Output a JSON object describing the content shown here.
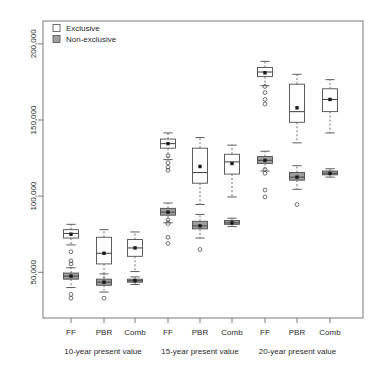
{
  "chart_data": {
    "type": "box",
    "title": "",
    "xlabel": "",
    "ylabel": "",
    "ylim": [
      20000,
      215000
    ],
    "yticks": [
      50000,
      100000,
      150000,
      200000
    ],
    "ytick_labels": [
      "50,000",
      "100,000",
      "150,000",
      "200,000"
    ],
    "grid": false,
    "legend": {
      "position": "top-left",
      "entries": [
        {
          "label": "Exclusive",
          "fill": "#ffffff",
          "stroke": "#4d4d4d"
        },
        {
          "label": "Non-exclusive",
          "fill": "#9e9e9e",
          "stroke": "#4d4d4d"
        }
      ]
    },
    "panels": [
      {
        "label": "10-year present value",
        "categories": [
          "FF",
          "PBR",
          "Comb"
        ]
      },
      {
        "label": "15-year present value",
        "categories": [
          "FF",
          "PBR",
          "Comb"
        ]
      },
      {
        "label": "20-year present value",
        "categories": [
          "FF",
          "PBR",
          "Comb"
        ]
      }
    ],
    "xtick_labels": [
      "FF",
      "PBR",
      "Comb",
      "FF",
      "PBR",
      "Comb",
      "FF",
      "PBR",
      "Comb"
    ],
    "series": [
      {
        "name": "Exclusive",
        "fill": "#ffffff",
        "boxes": [
          {
            "panel": "10-year present value",
            "category": "FF",
            "whisker_low": 68000,
            "q1": 72500,
            "median": 75500,
            "q3": 78000,
            "whisker_high": 81500,
            "mean": 75000,
            "outliers": [
              63500,
              57500,
              55500
            ]
          },
          {
            "panel": "10-year present value",
            "category": "PBR",
            "whisker_low": 43500,
            "q1": 55500,
            "median": 62500,
            "q3": 73000,
            "whisker_high": 78000,
            "mean": 62500,
            "outliers": []
          },
          {
            "panel": "10-year present value",
            "category": "Comb",
            "whisker_low": 50500,
            "q1": 60500,
            "median": 66000,
            "q3": 71500,
            "whisker_high": 76500,
            "mean": 66000,
            "outliers": []
          },
          {
            "panel": "15-year present value",
            "category": "FF",
            "whisker_low": 124000,
            "q1": 131500,
            "median": 134500,
            "q3": 137500,
            "whisker_high": 141500,
            "mean": 134500,
            "outliers": [
              126500,
              122000,
              119000,
              117000
            ]
          },
          {
            "panel": "15-year present value",
            "category": "PBR",
            "whisker_low": 94500,
            "q1": 108500,
            "median": 115500,
            "q3": 131500,
            "whisker_high": 138500,
            "mean": 119500,
            "outliers": []
          },
          {
            "panel": "15-year present value",
            "category": "Comb",
            "whisker_low": 99500,
            "q1": 114500,
            "median": 122500,
            "q3": 127500,
            "whisker_high": 133500,
            "mean": 121500,
            "outliers": []
          },
          {
            "panel": "20-year present value",
            "category": "FF",
            "whisker_low": 172500,
            "q1": 178500,
            "median": 181500,
            "q3": 184500,
            "whisker_high": 188500,
            "mean": 181000,
            "outliers": [
              172000,
              168000,
              163500,
              160500
            ]
          },
          {
            "panel": "20-year present value",
            "category": "PBR",
            "whisker_low": 135000,
            "q1": 148500,
            "median": 155500,
            "q3": 173500,
            "whisker_high": 180000,
            "mean": 158000,
            "outliers": []
          },
          {
            "panel": "20-year present value",
            "category": "Comb",
            "whisker_low": 141500,
            "q1": 155500,
            "median": 163500,
            "q3": 170500,
            "whisker_high": 176500,
            "mean": 163500,
            "outliers": []
          }
        ]
      },
      {
        "name": "Non-exclusive",
        "fill": "#9e9e9e",
        "boxes": [
          {
            "panel": "10-year present value",
            "category": "FF",
            "whisker_low": 40000,
            "q1": 45500,
            "median": 47500,
            "q3": 49500,
            "whisker_high": 53000,
            "mean": 47500,
            "outliers": [
              35500,
              33000
            ]
          },
          {
            "panel": "10-year present value",
            "category": "PBR",
            "whisker_low": 37000,
            "q1": 41500,
            "median": 43500,
            "q3": 45500,
            "whisker_high": 49000,
            "mean": 43500,
            "outliers": [
              33000
            ]
          },
          {
            "panel": "10-year present value",
            "category": "Comb",
            "whisker_low": 42000,
            "q1": 43500,
            "median": 44500,
            "q3": 45500,
            "whisker_high": 47000,
            "mean": 44500,
            "outliers": []
          },
          {
            "panel": "15-year present value",
            "category": "FF",
            "whisker_low": 82500,
            "q1": 87500,
            "median": 89500,
            "q3": 92000,
            "whisker_high": 95500,
            "mean": 89500,
            "outliers": [
              84500,
              82000,
              73000,
              69000
            ]
          },
          {
            "panel": "15-year present value",
            "category": "PBR",
            "whisker_low": 72500,
            "q1": 78500,
            "median": 80500,
            "q3": 83500,
            "whisker_high": 88000,
            "mean": 80500,
            "outliers": [
              65000
            ]
          },
          {
            "panel": "15-year present value",
            "category": "Comb",
            "whisker_low": 80000,
            "q1": 81500,
            "median": 82500,
            "q3": 84000,
            "whisker_high": 85500,
            "mean": 82500,
            "outliers": []
          },
          {
            "panel": "20-year present value",
            "category": "FF",
            "whisker_low": 116500,
            "q1": 121500,
            "median": 123500,
            "q3": 126000,
            "whisker_high": 129500,
            "mean": 123500,
            "outliers": [
              117500,
              115000,
              104000,
              99500
            ]
          },
          {
            "panel": "20-year present value",
            "category": "PBR",
            "whisker_low": 104500,
            "q1": 110500,
            "median": 112500,
            "q3": 115500,
            "whisker_high": 120000,
            "mean": 112500,
            "outliers": [
              94500
            ]
          },
          {
            "panel": "20-year present value",
            "category": "Comb",
            "whisker_low": 112500,
            "q1": 114000,
            "median": 115000,
            "q3": 116500,
            "whisker_high": 118000,
            "mean": 115000,
            "outliers": []
          }
        ]
      }
    ]
  }
}
